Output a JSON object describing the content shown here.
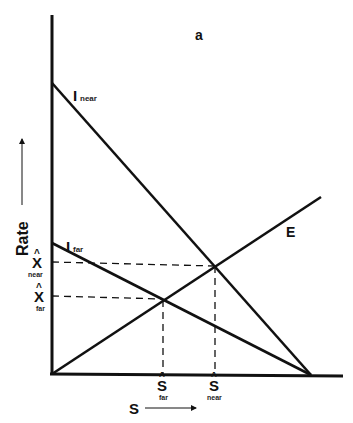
{
  "panel_label": "a",
  "axes": {
    "y_label": "Rate",
    "x_label": "S",
    "origin": [
      52,
      374
    ],
    "y_top": 15,
    "x_right": 343
  },
  "lines": {
    "I_near": {
      "label_main": "I",
      "label_sub": "near",
      "from": [
        52,
        83
      ],
      "to": [
        311,
        375
      ]
    },
    "I_far": {
      "label_main": "I",
      "label_sub": "far",
      "from": [
        52,
        243
      ],
      "to": [
        311,
        375
      ]
    },
    "E": {
      "label_main": "E",
      "from": [
        52,
        374
      ],
      "to": [
        321,
        197
      ]
    }
  },
  "equilibria": {
    "near": {
      "x_label_main": "Ŝ",
      "x_label_sub": "near",
      "y_label_main": "X̂",
      "y_label_sub": "near",
      "point": [
        215,
        265
      ]
    },
    "far": {
      "x_label_main": "Ŝ",
      "x_label_sub": "far",
      "y_label_main": "X̂",
      "y_label_sub": "far",
      "point": [
        163,
        299
      ]
    }
  },
  "colors": {
    "line": "#111111",
    "background": "#ffffff"
  }
}
